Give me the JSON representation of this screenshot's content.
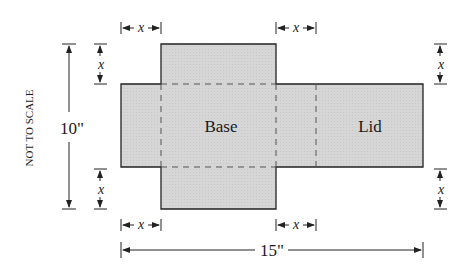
{
  "diagram": {
    "side_note": "NOT TO SCALE",
    "panels": [
      {
        "label": "Base"
      },
      {
        "label": "Lid"
      }
    ],
    "dimensions": {
      "height": "10\"",
      "width": "15\"",
      "cut": "x"
    },
    "colors": {
      "fill": "#d4d4d4",
      "stroke": "#222222",
      "fold": "#555555"
    }
  }
}
